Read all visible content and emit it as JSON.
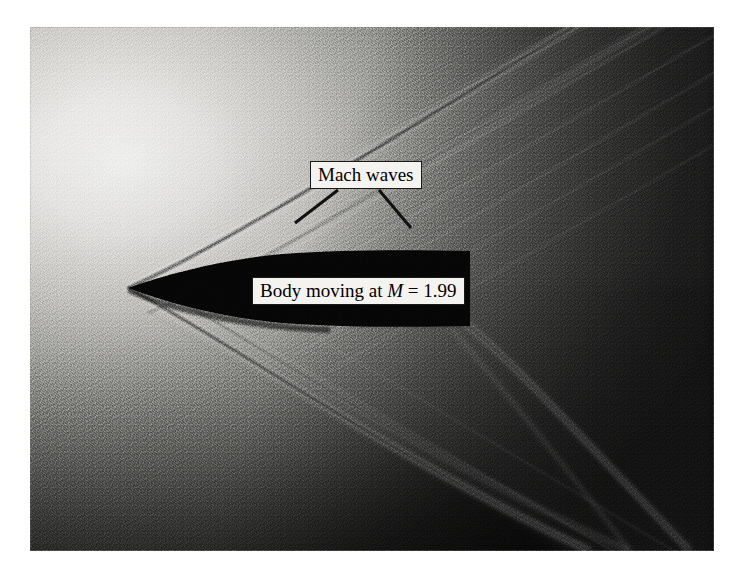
{
  "figure": {
    "kind": "schlieren-photograph",
    "photo_frame": {
      "x": 30,
      "y": 27,
      "width": 684,
      "height": 524
    },
    "page_background": "#ffffff"
  },
  "labels": {
    "mach_waves": {
      "text": "Mach waves",
      "box": {
        "x": 310,
        "y": 161,
        "width": 116,
        "height": 28
      },
      "background": "#f4f3f0",
      "border_color": "#1a1a1a",
      "text_color": "#000000"
    },
    "body_moving": {
      "prefix": "Body moving at ",
      "symbol": "M",
      "equals": " = ",
      "mach_number": "1.99",
      "full_text": "Body moving at M = 1.99",
      "box": {
        "x": 252,
        "y": 277,
        "width": 204,
        "height": 28
      },
      "background": "#f4f3f0",
      "border_color": "#1a1a1a",
      "text_color": "#000000"
    }
  },
  "leader_lines": [
    {
      "name": "mach-waves-leader-left",
      "x1": 338,
      "y1": 190,
      "x2": 295,
      "y2": 223
    },
    {
      "name": "mach-waves-leader-right",
      "x1": 379,
      "y1": 190,
      "x2": 411,
      "y2": 228
    }
  ],
  "scene": {
    "body": {
      "name": "projectile-silhouette",
      "color": "#060606",
      "nose_tip": {
        "x": 128,
        "y": 288
      },
      "tail_x": 470,
      "top_y": 252,
      "bottom_y": 326,
      "shape": "ogive-nosed cylindrical bullet"
    },
    "bow_shock": {
      "name": "bow-shock",
      "origin": {
        "x": 128,
        "y": 288
      },
      "upper_angle_deg": 31,
      "lower_angle_deg": 31,
      "color": "#2b2b2b"
    },
    "tail_shock": {
      "name": "recompression-shock",
      "origin": {
        "x": 462,
        "y": 320
      },
      "angle_deg": 33,
      "color": "#3a3a3a"
    },
    "mach_wave_family": {
      "name": "mach-wave-lines",
      "count": 7,
      "angle_deg": 31,
      "description": "faint parallel weak waves trailing the bow shock"
    },
    "illumination": {
      "bright_region": "upper-left",
      "dark_region": "right and lower-right",
      "bright_hex": "#f2f1ef",
      "midtone_hex": "#8b8b88",
      "dark_hex": "#1d1d1d"
    }
  }
}
